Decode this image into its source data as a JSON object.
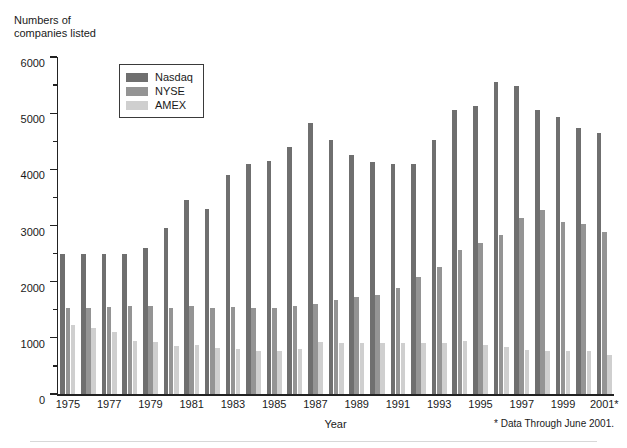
{
  "chart_data": {
    "type": "bar",
    "title": "",
    "subtitle": "",
    "ylabel": "Numbers of\ncompanies listed",
    "xlabel": "Year",
    "ylim": [
      0,
      6000
    ],
    "y_ticks_major": [
      0,
      1000,
      2000,
      3000,
      4000,
      5000,
      6000
    ],
    "y_ticks_minor": [
      500,
      1500,
      2500,
      3500,
      4500,
      5500
    ],
    "y_tick_labels": [
      "0",
      "1000",
      "2000",
      "3000",
      "4000",
      "5000",
      "6000"
    ],
    "grid": false,
    "legend_position": "upper-left-inside",
    "annotation": "* Data Through June 2001.",
    "categories": [
      "1975",
      "1976",
      "1977",
      "1978",
      "1979",
      "1980",
      "1981",
      "1982",
      "1983",
      "1984",
      "1985",
      "1986",
      "1987",
      "1988",
      "1989",
      "1990",
      "1991",
      "1992",
      "1993",
      "1994",
      "1995",
      "1996",
      "1997",
      "1998",
      "1999",
      "2000",
      "2001*"
    ],
    "x_tick_labels": [
      "1975",
      "1977",
      "1979",
      "1981",
      "1983",
      "1985",
      "1987",
      "1989",
      "1991",
      "1993",
      "1995",
      "1997",
      "1999",
      "2001*"
    ],
    "series": [
      {
        "name": "Nasdaq",
        "color": "#6f6f6f",
        "values": [
          2500,
          2500,
          2500,
          2500,
          2600,
          2950,
          3450,
          3300,
          3900,
          4100,
          4140,
          4400,
          4830,
          4520,
          4250,
          4130,
          4090,
          4090,
          4530,
          5060,
          5130,
          5560,
          5490,
          5060,
          4940,
          4730,
          4640
        ]
      },
      {
        "name": "NYSE",
        "color": "#949494",
        "values": [
          1530,
          1540,
          1550,
          1560,
          1560,
          1540,
          1560,
          1530,
          1550,
          1540,
          1540,
          1570,
          1600,
          1680,
          1730,
          1770,
          1890,
          2090,
          2260,
          2570,
          2680,
          2830,
          3130,
          3280,
          3070,
          3030,
          2890
        ]
      },
      {
        "name": "AMEX",
        "color": "#cfcfcf",
        "values": [
          1230,
          1180,
          1100,
          950,
          930,
          860,
          870,
          820,
          800,
          770,
          760,
          800,
          930,
          900,
          900,
          900,
          900,
          900,
          900,
          940,
          880,
          830,
          780,
          770,
          770,
          770,
          700
        ]
      }
    ]
  },
  "legend": {
    "items": [
      {
        "label": "Nasdaq",
        "color": "#6f6f6f"
      },
      {
        "label": "NYSE",
        "color": "#949494"
      },
      {
        "label": "AMEX",
        "color": "#cfcfcf"
      }
    ]
  },
  "axis": {
    "y_title": "Numbers of\ncompanies listed",
    "x_title": "Year"
  },
  "footnote": "* Data Through June 2001."
}
